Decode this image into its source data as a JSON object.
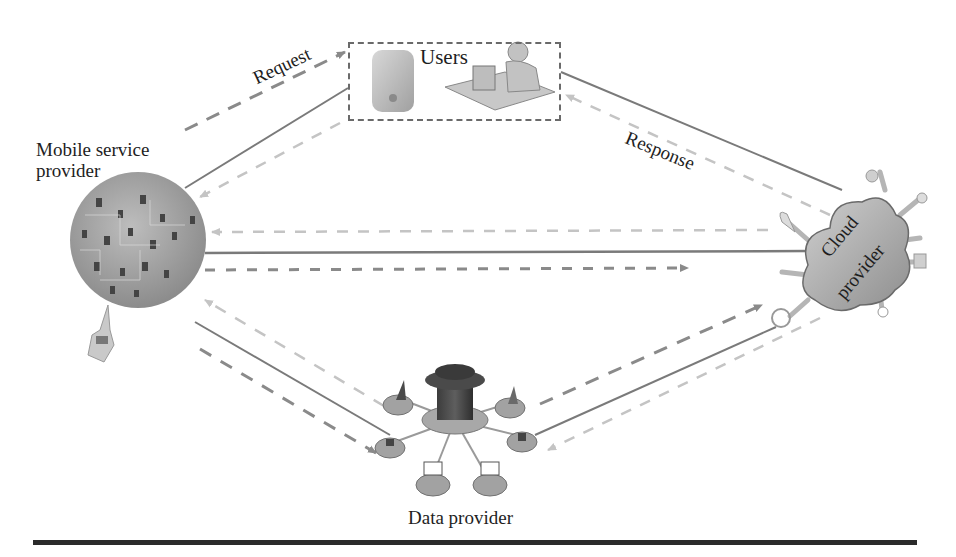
{
  "figure": {
    "type": "architecture-diagram",
    "nodes": {
      "users": {
        "label": "Users",
        "icons": [
          "mobile-phone-icon",
          "user-at-computer-icon"
        ]
      },
      "mobile_service_provider": {
        "label_line1": "Mobile service",
        "label_line2": "provider",
        "icon": "device-network-globe-icon"
      },
      "cloud_provider": {
        "label_line1": "Cloud",
        "label_line2": "provider",
        "icon": "cloud-icon"
      },
      "data_provider": {
        "label": "Data provider",
        "icon": "database-network-icon"
      }
    },
    "edge_labels": {
      "request": "Request",
      "response": "Response"
    },
    "edges": [
      {
        "from": "mobile_service_provider",
        "to": "users",
        "style": "dashed-dark",
        "label": "Request"
      },
      {
        "from": "mobile_service_provider",
        "to": "users",
        "style": "solid"
      },
      {
        "from": "users",
        "to": "mobile_service_provider",
        "style": "dashed-light"
      },
      {
        "from": "users",
        "to": "cloud_provider",
        "style": "solid"
      },
      {
        "from": "cloud_provider",
        "to": "users",
        "style": "dashed-light",
        "label": "Response"
      },
      {
        "from": "cloud_provider",
        "to": "mobile_service_provider",
        "style": "dashed-light"
      },
      {
        "from": "mobile_service_provider",
        "to": "cloud_provider",
        "style": "solid"
      },
      {
        "from": "mobile_service_provider",
        "to": "cloud_provider",
        "style": "dashed-dark"
      },
      {
        "from": "data_provider",
        "to": "mobile_service_provider",
        "style": "dashed-light"
      },
      {
        "from": "mobile_service_provider",
        "to": "data_provider",
        "style": "solid"
      },
      {
        "from": "mobile_service_provider",
        "to": "data_provider",
        "style": "dashed-dark"
      },
      {
        "from": "data_provider",
        "to": "cloud_provider",
        "style": "dashed-dark"
      },
      {
        "from": "data_provider",
        "to": "cloud_provider",
        "style": "solid"
      },
      {
        "from": "cloud_provider",
        "to": "data_provider",
        "style": "dashed-light"
      }
    ],
    "colors": {
      "solid_line": "#7a7a7a",
      "dashed_dark": "#8a8a8a",
      "dashed_light": "#c4c4c4",
      "node_fill": "#9a9a9a",
      "rule": "#2b2b2b"
    }
  }
}
